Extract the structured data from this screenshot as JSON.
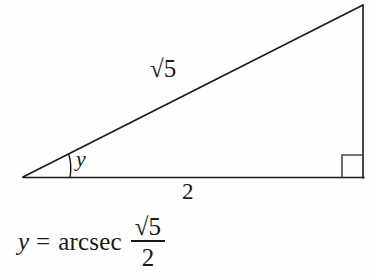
{
  "figure": {
    "type": "right-triangle-diagram",
    "background_color": "#fefefe",
    "line_color": "#1a1a1a",
    "labels": {
      "hypotenuse": "√5",
      "base": "2",
      "angle": "y",
      "right_angle_marker": "90°"
    },
    "geometry": {
      "apex_vertex": "(23, 177)",
      "bottom_right_vertex": "(363, 178)",
      "top_right_vertex": "(363, 5)",
      "base_length_value": 2,
      "hypotenuse_length_value": "√5",
      "opposite_length_value": 1
    }
  },
  "equation": {
    "variable": "y",
    "equals": "=",
    "function_name": "arcsec",
    "numerator": "√5",
    "denominator": "2",
    "full_text": "y = arcsec √5/2"
  }
}
